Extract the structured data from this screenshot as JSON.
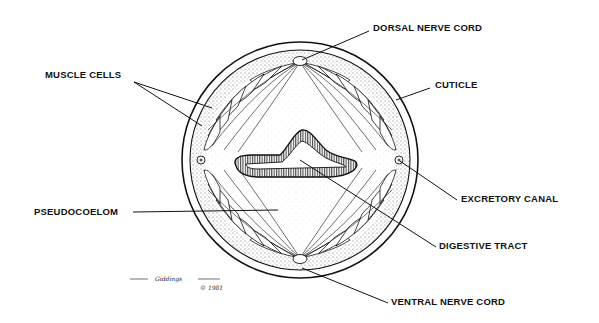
{
  "diagram": {
    "labels": {
      "muscle_cells": "MUSCLE CELLS",
      "dorsal_nerve_cord": "DORSAL NERVE CORD",
      "cuticle": "CUTICLE",
      "excretory_canal": "EXCRETORY CANAL",
      "pseudocoelom": "PSEUDOCOELOM",
      "digestive_tract": "DIGESTIVE TRACT",
      "ventral_nerve_cord": "VENTRAL NERVE CORD"
    },
    "signature": {
      "artist": "Giddings",
      "copyright": "© 1981"
    },
    "colors": {
      "ink": "#111111",
      "background": "#ffffff",
      "stipple": "#8a8a8a"
    }
  }
}
